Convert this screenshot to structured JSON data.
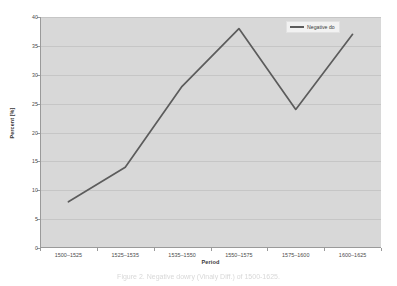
{
  "figure": {
    "caption": "Figure 2. Negative dowry (Vinaly Diff.) of 1500-1625."
  },
  "chart_data": {
    "type": "line",
    "title": "",
    "categories": [
      "1500–1525",
      "1525–1535",
      "1535–1550",
      "1550–1575",
      "1575–1600",
      "1600–1625"
    ],
    "series": [
      {
        "name": "Negative do",
        "values": [
          8,
          14,
          28,
          38,
          24,
          37
        ],
        "color": "#5c5c5c"
      }
    ],
    "xlabel": "Period",
    "ylabel": "Percent [%]",
    "ylim": [
      0,
      40
    ],
    "ytick_step": 5,
    "yticks": [
      "40",
      "35",
      "30",
      "25",
      "20",
      "15",
      "10",
      "5",
      "0"
    ],
    "grid": true,
    "legend_position": "top-right",
    "plot_background": "#d8d8d8",
    "figure_background": "#ffffff",
    "gridline_color": "#c6c6c6",
    "axis_color": "#9a9a9a"
  }
}
